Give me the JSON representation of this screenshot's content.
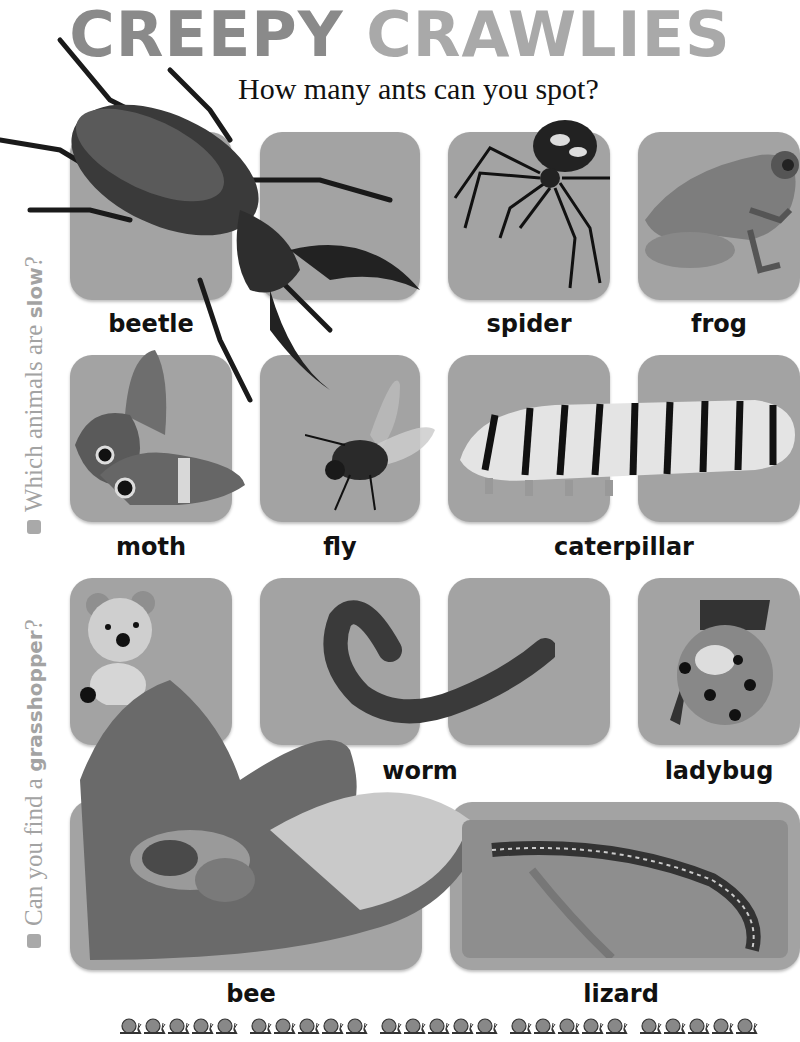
{
  "title": {
    "word1": "CREEPY",
    "word2": "CRAWLIES"
  },
  "subtitle": "How many ants can you spot?",
  "side_prompts": [
    {
      "text_before": "Which animals are ",
      "bold": "slow",
      "text_after": "?"
    },
    {
      "text_before": "Can you find a ",
      "bold": "grasshopper",
      "text_after": "?"
    }
  ],
  "animals": [
    {
      "name": "beetle"
    },
    {
      "name": "spider"
    },
    {
      "name": "frog"
    },
    {
      "name": "moth"
    },
    {
      "name": "fly"
    },
    {
      "name": "caterpillar"
    },
    {
      "name": "worm"
    },
    {
      "name": "ladybug"
    },
    {
      "name": "bee"
    },
    {
      "name": "lizard"
    }
  ],
  "footer": {
    "snail_groups": 5,
    "snails_per_group": 5,
    "icon": "snail-icon"
  },
  "colors": {
    "card": "#a3a3a3",
    "title_dark": "#8a8a8a",
    "title_light": "#a9a9a9",
    "side_text": "#a3a3a3"
  }
}
